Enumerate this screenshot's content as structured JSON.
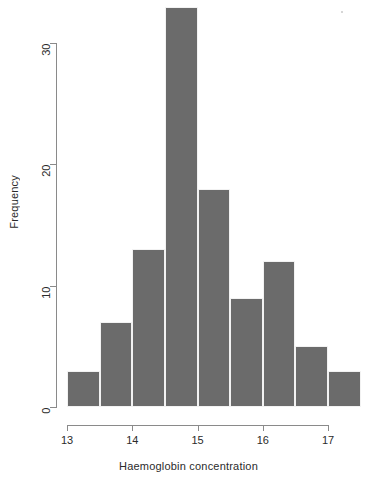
{
  "chart_data": {
    "type": "bar",
    "title": "",
    "subtitle": "",
    "xlabel": "Haemoglobin concentration",
    "ylabel": "Frequency",
    "grid": false,
    "legend": null,
    "bin_width": 0.5,
    "bin_edges": [
      13.0,
      13.5,
      14.0,
      14.5,
      15.0,
      15.5,
      16.0,
      16.5,
      17.0,
      17.5
    ],
    "categories": [
      "13.0-13.5",
      "13.5-14.0",
      "14.0-14.5",
      "14.5-15.0",
      "15.0-15.5",
      "15.5-16.0",
      "16.0-16.5",
      "16.5-17.0",
      "17.0-17.5"
    ],
    "values": [
      3,
      7,
      13,
      33,
      18,
      9,
      12,
      5,
      3
    ],
    "xlim": [
      13.0,
      17.5
    ],
    "ylim": [
      0,
      33
    ],
    "x_ticks": [
      13,
      14,
      15,
      16,
      17
    ],
    "x_tick_labels": [
      "13",
      "14",
      "15",
      "16",
      "17"
    ],
    "y_ticks": [
      0,
      10,
      20,
      30
    ],
    "y_tick_labels": [
      "0",
      "10",
      "20",
      "30"
    ],
    "bar_color": "#6b6b6b",
    "bar_border_color": "#f2f2f2",
    "axis_color": "#8a8a8a",
    "background": "#ffffff",
    "total_count": 103
  }
}
